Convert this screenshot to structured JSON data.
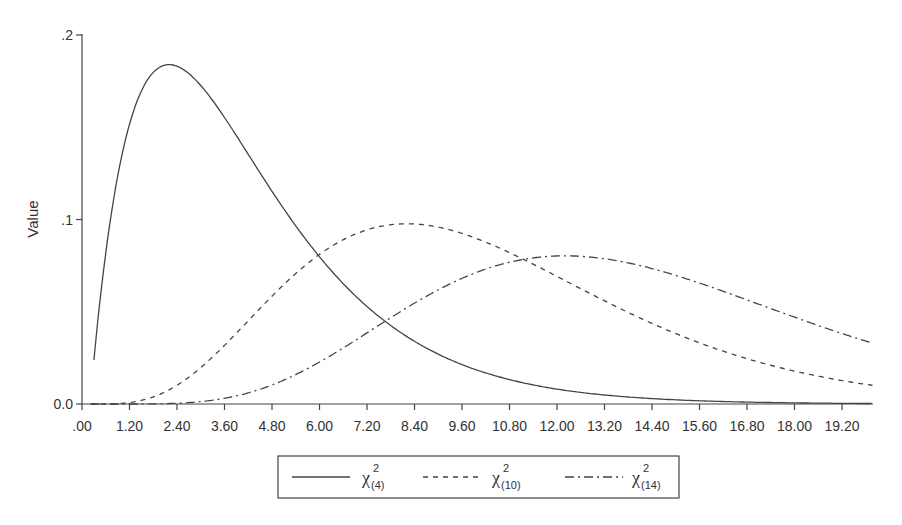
{
  "chart_data": {
    "type": "line",
    "title": "",
    "xlabel": "",
    "ylabel": "Value",
    "xlim": [
      0,
      20
    ],
    "ylim": [
      0,
      0.2
    ],
    "grid": false,
    "legend_position": "bottom",
    "x_tick_labels": [
      ".00",
      "1.20",
      "2.40",
      "3.60",
      "4.80",
      "6.00",
      "7.20",
      "8.40",
      "9.60",
      "10.80",
      "12.00",
      "13.20",
      "14.40",
      "15.60",
      "16.80",
      "18.00",
      "19.20"
    ],
    "x_tick_values": [
      0,
      1.2,
      2.4,
      3.6,
      4.8,
      6.0,
      7.2,
      8.4,
      9.6,
      10.8,
      12.0,
      13.2,
      14.4,
      15.6,
      16.8,
      18.0,
      19.2
    ],
    "y_tick_labels": [
      "0.0",
      ".1",
      ".2"
    ],
    "y_tick_values": [
      0,
      0.1,
      0.2
    ],
    "x": [
      0.1,
      0.5,
      1.0,
      1.5,
      2.0,
      2.5,
      3.0,
      4.0,
      5.0,
      6.0,
      7.0,
      8.0,
      9.0,
      10.0,
      11.0,
      12.0,
      13.0,
      14.0,
      15.0,
      16.0,
      17.0,
      18.0,
      19.0,
      19.8
    ],
    "series": [
      {
        "name": "χ²(4)",
        "label_main": "χ",
        "label_sup": "2",
        "label_sub": "(4)",
        "df": 4,
        "style": "solid",
        "values": [
          0.0238,
          0.0974,
          0.1516,
          0.1771,
          0.1839,
          0.1791,
          0.1673,
          0.1353,
          0.1026,
          0.0747,
          0.0528,
          0.0366,
          0.025,
          0.0168,
          0.0112,
          0.0074,
          0.0049,
          0.0032,
          0.0021,
          0.0013,
          0.0009,
          0.0006,
          0.0004,
          0.0002
        ]
      },
      {
        "name": "χ²(10)",
        "label_main": "χ",
        "label_sup": "2",
        "label_sub": "(10)",
        "df": 10,
        "style": "dashed",
        "values": [
          0.0,
          0.0001,
          0.0008,
          0.0031,
          0.0077,
          0.0145,
          0.0235,
          0.0451,
          0.0668,
          0.084,
          0.0944,
          0.0977,
          0.0949,
          0.0877,
          0.0777,
          0.0664,
          0.0551,
          0.0446,
          0.0353,
          0.0275,
          0.021,
          0.0157,
          0.0117,
          0.0091
        ]
      },
      {
        "name": "χ²(14)",
        "label_main": "χ",
        "label_sup": "2",
        "label_sub": "(14)",
        "df": 14,
        "style": "dash-dot",
        "values": [
          0.0,
          0.0,
          0.0,
          0.0,
          0.0002,
          0.0005,
          0.0012,
          0.0045,
          0.0111,
          0.0206,
          0.0316,
          0.0428,
          0.0535,
          0.0627,
          0.0702,
          0.0755,
          0.0786,
          0.0789,
          0.0785,
          0.076,
          0.0725,
          0.0676,
          0.0625,
          0.0577
        ]
      }
    ]
  },
  "colors": {
    "axis": "#444444",
    "curve": "#444444",
    "text": "#333333",
    "background": "#ffffff"
  }
}
